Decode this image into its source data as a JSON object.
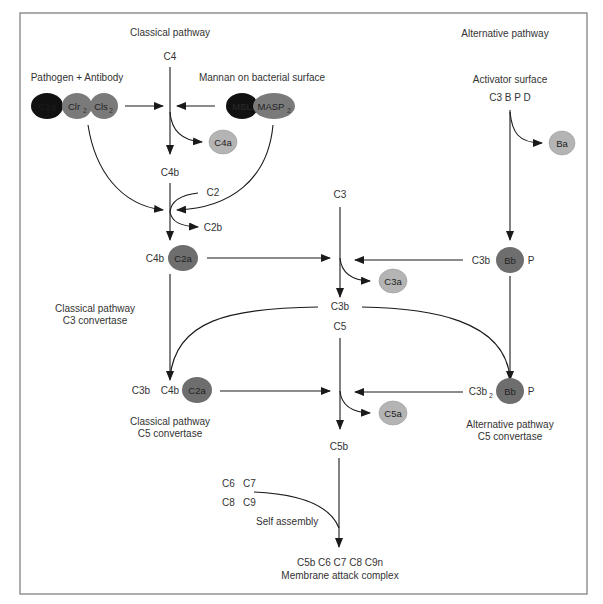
{
  "titles": {
    "classical": "Classical pathway",
    "alternative": "Alternative pathway"
  },
  "classical": {
    "c4": "C4",
    "pathogen_antibody": "Pathogen + Antibody",
    "mannan": "Mannan on bacterial surface",
    "c1q": "C1q",
    "clr": "Clr",
    "clr_sub": "2",
    "cls": "Cls",
    "cls_sub": "2",
    "mbl": "MBL",
    "masp": "MASP",
    "masp_sub": "2",
    "c4a": "C4a",
    "c4b": "C4b",
    "c2": "C2",
    "c2b": "C2b",
    "c4b_conv": "C4b",
    "c2a": "C2a",
    "c3_convertase_line1": "Classical pathway",
    "c3_convertase_line2": "C3 convertase",
    "c5_c3b": "C3b",
    "c5_c4b": "C4b",
    "c5_c2a": "C2a",
    "c5_convertase_line1": "Classical pathway",
    "c5_convertase_line2": "C5 convertase"
  },
  "central": {
    "c3": "C3",
    "c3a": "C3a",
    "c3b": "C3b",
    "c5": "C5",
    "c5a": "C5a",
    "c5b": "C5b",
    "c6c7": "C6   C7",
    "c8c9": "C8   C9",
    "self_assembly": "Self assembly",
    "mac_line1": "C5b C6 C7 C8 C9n",
    "mac_line2": "Membrane attack complex"
  },
  "alternative": {
    "activator_surface": "Activator surface",
    "components": "C3 B P D",
    "ba": "Ba",
    "c3b": "C3b",
    "bb": "Bb",
    "p": "P",
    "c3b2": "C3b",
    "c3b2_sub": "2",
    "bb2": "Bb",
    "p2": "P",
    "c5_convertase_line1": "Alternative pathway",
    "c5_convertase_line2": "C5 convertase"
  },
  "colors": {
    "dark_ellipse": "#111111",
    "mid_ellipse": "#7a7a7a",
    "c2a_bb": "#6e6e6e",
    "light_ellipse": "#b4b4b4",
    "frame": "#8a8a8a",
    "text": "#333333"
  }
}
